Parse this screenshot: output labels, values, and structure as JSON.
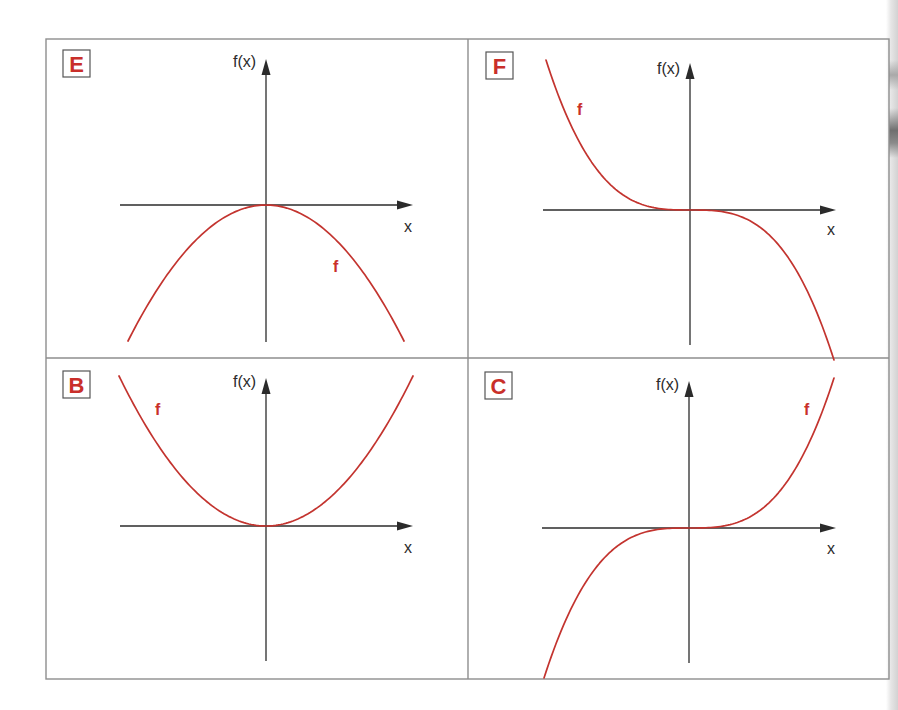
{
  "figure": {
    "colors": {
      "curve": "#c3342f",
      "label_letter": "#c92f2a",
      "axis": "#2b2b2b",
      "frame": "#8e8e8e"
    },
    "panels": [
      {
        "id": "E",
        "label": "E",
        "y_axis_label": "f(x)",
        "x_axis_label": "x",
        "curve_label": "f",
        "shape": "-x^2",
        "origin": [
          266,
          205
        ],
        "y_axis": [
          59,
          342
        ],
        "x_axis": [
          120,
          413
        ],
        "half_width": 138,
        "half_height": 136,
        "label_box": [
          63,
          50,
          27,
          27
        ],
        "ylabel_pos": [
          233,
          67
        ],
        "xlabel_pos": [
          404,
          232
        ],
        "flabel_pos": [
          333,
          272
        ]
      },
      {
        "id": "F",
        "label": "F",
        "y_axis_label": "f(x)",
        "x_axis_label": "x",
        "curve_label": "f",
        "shape": "-x^3",
        "origin": [
          690,
          210
        ],
        "y_axis": [
          63,
          345
        ],
        "x_axis": [
          543,
          836
        ],
        "half_width": 144,
        "half_height": 150,
        "label_box": [
          486,
          52,
          27,
          27
        ],
        "ylabel_pos": [
          657,
          74
        ],
        "xlabel_pos": [
          827,
          235
        ],
        "flabel_pos": [
          577,
          115
        ]
      },
      {
        "id": "B",
        "label": "B",
        "y_axis_label": "f(x)",
        "x_axis_label": "x",
        "curve_label": "f",
        "shape": "x^2",
        "origin": [
          266,
          526
        ],
        "y_axis": [
          378,
          661
        ],
        "x_axis": [
          120,
          413
        ],
        "half_width": 147,
        "half_height": 150,
        "label_box": [
          63,
          371,
          27,
          27
        ],
        "ylabel_pos": [
          233,
          387
        ],
        "xlabel_pos": [
          404,
          553
        ],
        "flabel_pos": [
          155,
          415
        ]
      },
      {
        "id": "C",
        "label": "C",
        "y_axis_label": "f(x)",
        "x_axis_label": "x",
        "curve_label": "f",
        "shape": "x^3",
        "origin": [
          689,
          528
        ],
        "y_axis": [
          381,
          663
        ],
        "x_axis": [
          542,
          836
        ],
        "half_width": 145,
        "half_height": 150,
        "label_box": [
          485,
          372,
          27,
          27
        ],
        "ylabel_pos": [
          656,
          390
        ],
        "xlabel_pos": [
          827,
          554
        ],
        "flabel_pos": [
          804,
          415
        ]
      }
    ],
    "frame": {
      "left": 46,
      "top": 39,
      "right": 889,
      "bottom": 679,
      "mid_x": 468,
      "mid_y": 358
    }
  },
  "chart_data": [
    {
      "type": "line",
      "title": "E",
      "xlabel": "x",
      "ylabel": "f(x)",
      "series": [
        {
          "name": "f",
          "function": "f(x) = -x^2",
          "x": [
            -1,
            -0.5,
            0,
            0.5,
            1
          ],
          "y": [
            -1,
            -0.25,
            0,
            -0.25,
            -1
          ]
        }
      ],
      "grid": false,
      "ticks": "none"
    },
    {
      "type": "line",
      "title": "F",
      "xlabel": "x",
      "ylabel": "f(x)",
      "series": [
        {
          "name": "f",
          "function": "f(x) = -x^3",
          "x": [
            -1,
            -0.5,
            0,
            0.5,
            1
          ],
          "y": [
            1,
            0.125,
            0,
            -0.125,
            -1
          ]
        }
      ],
      "grid": false,
      "ticks": "none"
    },
    {
      "type": "line",
      "title": "B",
      "xlabel": "x",
      "ylabel": "f(x)",
      "series": [
        {
          "name": "f",
          "function": "f(x) = x^2",
          "x": [
            -1,
            -0.5,
            0,
            0.5,
            1
          ],
          "y": [
            1,
            0.25,
            0,
            0.25,
            1
          ]
        }
      ],
      "grid": false,
      "ticks": "none"
    },
    {
      "type": "line",
      "title": "C",
      "xlabel": "x",
      "ylabel": "f(x)",
      "series": [
        {
          "name": "f",
          "function": "f(x) = x^3",
          "x": [
            -1,
            -0.5,
            0,
            0.5,
            1
          ],
          "y": [
            -1,
            -0.125,
            0,
            0.125,
            1
          ]
        }
      ],
      "grid": false,
      "ticks": "none"
    }
  ]
}
